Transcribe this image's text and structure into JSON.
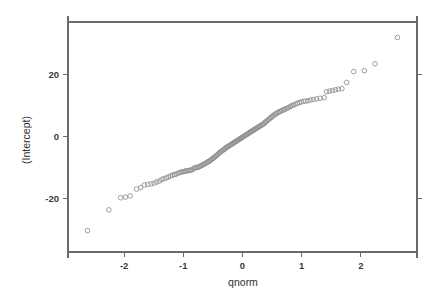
{
  "chart_data": {
    "type": "scatter",
    "title": "",
    "subtitle": "",
    "xlabel": "qnorm",
    "ylabel": "(Intercept)",
    "xlim": [
      -2.95,
      2.95
    ],
    "ylim": [
      -37.2,
      37.0
    ],
    "grid": false,
    "legend": null,
    "legend_position": "none",
    "x_ticks": [
      -2,
      -1,
      0,
      1,
      2
    ],
    "x_tick_labels": [
      "-2",
      "-1",
      "0",
      "1",
      "2"
    ],
    "y_ticks": [
      -20,
      0,
      20
    ],
    "y_tick_labels": [
      "-20",
      "0",
      "20"
    ],
    "marker": {
      "shape": "open-circle",
      "radius_px": 2.3,
      "stroke_color": "#8c8c8c",
      "fill": "none"
    },
    "axis_color": "#6b6b6b",
    "background_color": "#ffffff",
    "n_points": 134,
    "x": [
      -2.62,
      -2.26,
      -2.06,
      -1.98,
      -1.9,
      -1.79,
      -1.72,
      -1.66,
      -1.6,
      -1.545,
      -1.495,
      -1.45,
      -1.405,
      -1.365,
      -1.325,
      -1.288,
      -1.252,
      -1.218,
      -1.185,
      -1.153,
      -1.122,
      -1.092,
      -1.063,
      -1.035,
      -1.008,
      -0.981,
      -0.955,
      -0.93,
      -0.905,
      -0.881,
      -0.857,
      -0.834,
      -0.811,
      -0.789,
      -0.767,
      -0.745,
      -0.724,
      -0.703,
      -0.682,
      -0.662,
      -0.642,
      -0.622,
      -0.603,
      -0.583,
      -0.564,
      -0.545,
      -0.527,
      -0.508,
      -0.49,
      -0.472,
      -0.454,
      -0.436,
      -0.418,
      -0.401,
      -0.383,
      -0.366,
      -0.349,
      -0.332,
      -0.315,
      -0.298,
      -0.281,
      -0.264,
      -0.248,
      -0.231,
      -0.215,
      -0.198,
      -0.182,
      -0.165,
      -0.149,
      -0.133,
      -0.116,
      -0.1,
      -0.084,
      -0.068,
      -0.052,
      -0.035,
      -0.019,
      -0.003,
      0.013,
      0.029,
      0.045,
      0.061,
      0.078,
      0.094,
      0.11,
      0.126,
      0.143,
      0.159,
      0.176,
      0.192,
      0.209,
      0.226,
      0.243,
      0.26,
      0.277,
      0.294,
      0.311,
      0.329,
      0.347,
      0.364,
      0.382,
      0.401,
      0.419,
      0.438,
      0.456,
      0.476,
      0.495,
      0.515,
      0.535,
      0.555,
      0.576,
      0.597,
      0.618,
      0.64,
      0.663,
      0.686,
      0.709,
      0.733,
      0.758,
      0.784,
      0.81,
      0.838,
      0.866,
      0.896,
      0.927,
      0.959,
      0.993,
      1.029,
      1.067,
      1.108,
      1.152,
      1.2,
      1.253,
      1.312,
      1.38,
      1.42,
      1.47,
      1.52,
      1.57,
      1.62,
      1.68,
      1.76,
      1.88,
      2.06,
      2.24,
      2.62
    ],
    "y": [
      -30.3,
      -23.6,
      -19.7,
      -19.5,
      -19.1,
      -16.9,
      -16.4,
      -15.6,
      -15.4,
      -15.2,
      -15.0,
      -14.6,
      -14.3,
      -13.8,
      -13.5,
      -13.3,
      -13.0,
      -12.7,
      -12.4,
      -12.2,
      -12.1,
      -11.8,
      -11.6,
      -11.4,
      -11.3,
      -11.2,
      -11.0,
      -11.0,
      -10.9,
      -10.8,
      -10.7,
      -10.4,
      -10.1,
      -10.0,
      -9.9,
      -9.8,
      -9.6,
      -9.4,
      -9.2,
      -9.0,
      -8.8,
      -8.6,
      -8.3,
      -8.1,
      -7.9,
      -7.7,
      -7.4,
      -7.1,
      -6.9,
      -6.6,
      -6.3,
      -6.0,
      -5.7,
      -5.4,
      -5.1,
      -4.9,
      -4.6,
      -4.4,
      -4.1,
      -3.9,
      -3.6,
      -3.4,
      -3.2,
      -3.0,
      -2.8,
      -2.6,
      -2.4,
      -2.2,
      -2.0,
      -1.8,
      -1.6,
      -1.4,
      -1.2,
      -1.0,
      -0.8,
      -0.6,
      -0.4,
      -0.2,
      0.0,
      0.2,
      0.4,
      0.6,
      0.8,
      1.0,
      1.2,
      1.4,
      1.6,
      1.8,
      2.0,
      2.2,
      2.4,
      2.6,
      2.8,
      3.0,
      3.2,
      3.4,
      3.6,
      3.8,
      4.0,
      4.3,
      4.6,
      4.9,
      5.2,
      5.5,
      5.8,
      6.1,
      6.4,
      6.7,
      7.0,
      7.3,
      7.5,
      7.8,
      8.0,
      8.2,
      8.4,
      8.6,
      8.8,
      9.0,
      9.2,
      9.5,
      9.8,
      10.0,
      10.2,
      10.5,
      10.8,
      11.0,
      11.2,
      11.4,
      11.5,
      11.6,
      11.8,
      12.0,
      12.2,
      12.4,
      12.6,
      14.5,
      14.7,
      14.9,
      15.1,
      15.3,
      15.5,
      17.5,
      21.0,
      21.3,
      23.5,
      32.0
    ]
  },
  "axes": {
    "x_title": "qnorm",
    "y_title": "(Intercept)"
  }
}
